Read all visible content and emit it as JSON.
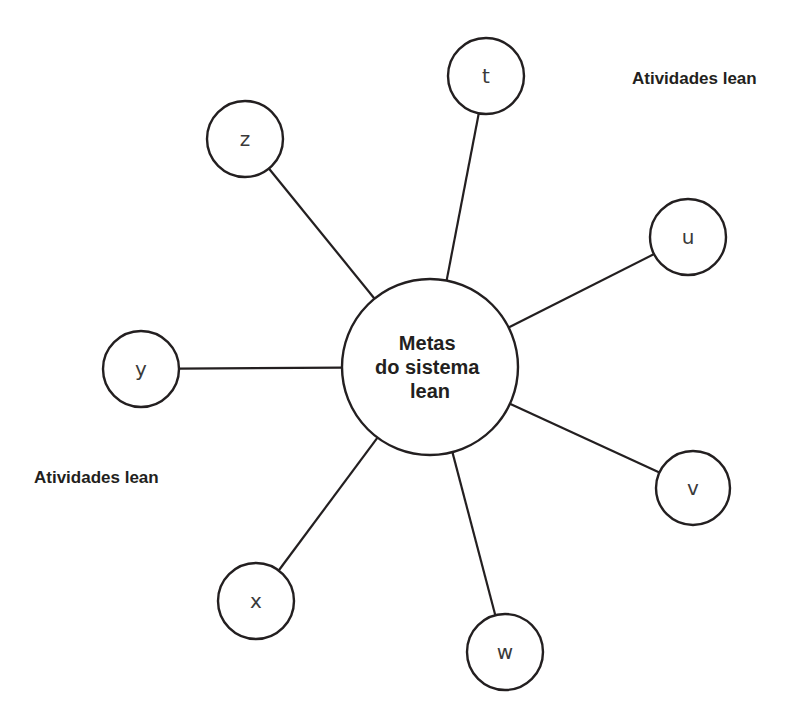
{
  "diagram": {
    "type": "hub-and-spoke",
    "center": {
      "id": "center",
      "lines": [
        "Metas",
        "do sistema",
        "lean"
      ],
      "cx": 430,
      "cy": 367,
      "r": 88
    },
    "nodes": [
      {
        "id": "t",
        "label": "t",
        "cx": 486,
        "cy": 76,
        "r": 38
      },
      {
        "id": "u",
        "label": "u",
        "cx": 688,
        "cy": 237,
        "r": 38
      },
      {
        "id": "v",
        "label": "v",
        "cx": 693,
        "cy": 488,
        "r": 37
      },
      {
        "id": "w",
        "label": "w",
        "cx": 505,
        "cy": 652,
        "r": 38
      },
      {
        "id": "x",
        "label": "x",
        "cx": 256,
        "cy": 601,
        "r": 38
      },
      {
        "id": "y",
        "label": "y",
        "cx": 141,
        "cy": 369,
        "r": 38
      },
      {
        "id": "z",
        "label": "z",
        "cx": 245,
        "cy": 139,
        "r": 38
      }
    ],
    "group_labels": [
      {
        "id": "top-right",
        "text": "Atividades lean",
        "x": 632,
        "y": 79
      },
      {
        "id": "bottom-left",
        "text": "Atividades lean",
        "x": 34,
        "y": 478
      }
    ],
    "colors": {
      "stroke": "#231f20",
      "background": "#ffffff",
      "node_text": "#3a3a3a"
    }
  }
}
